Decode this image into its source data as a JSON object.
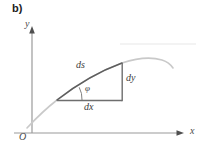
{
  "figure": {
    "panel_letter": "b)",
    "background_color": "#ffffff"
  },
  "axes": {
    "y_label": "y",
    "x_label": "x",
    "origin_label": "O",
    "axis_color": "#8a8a8a",
    "arrow_color": "#555555",
    "y_axis": {
      "x": 32,
      "y_top": 27,
      "y_bottom": 133
    },
    "x_axis": {
      "y": 133,
      "x_left": 14,
      "x_right": 180
    }
  },
  "annotations": {
    "ds": "ds",
    "dy": "dy",
    "dx": "dx",
    "phi": "φ"
  },
  "colors": {
    "curve_light": "#c9c9c9",
    "curve_highlight": "#5a5a5a",
    "triangle_leg": "#6e6e6e",
    "arc": "#7a7a7a",
    "text": "#3a3a3a",
    "panel_letter": "#1c1c1c",
    "artifact_line": "#ececec"
  },
  "geometry": {
    "triangle": {
      "left_vertex": {
        "x": 57,
        "y": 100
      },
      "corner_vertex": {
        "x": 122,
        "y": 101
      },
      "top_vertex": {
        "x": 122,
        "y": 63
      }
    },
    "curve_path": "M 27 128 C 40 114, 48 107, 57 100 C 75 86, 100 71, 122 63 C 140 57, 152 57, 162 60 C 168 62, 171 65, 173 68",
    "curve_highlight_path": "M 57 100 C 75 86, 100 71, 122 63",
    "angle_arc_path": "M 80 99.6 A 23 23 0 0 0 77.5 87.5",
    "artifact_line": {
      "x1": 120,
      "x2": 196,
      "y": 44
    }
  }
}
